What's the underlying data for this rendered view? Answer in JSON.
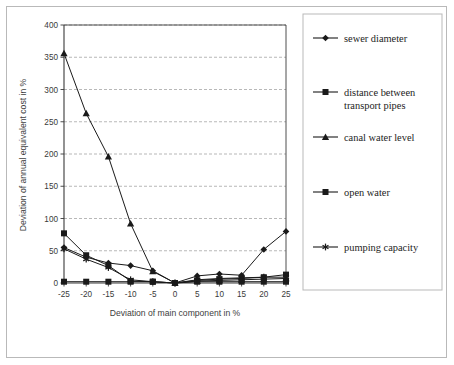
{
  "figure": {
    "name": "sensitivity-analysis-line-chart",
    "background": "#ffffff",
    "frame_color": "#b9b9b9"
  },
  "chart_data": {
    "type": "line",
    "title": "",
    "subtitle": "",
    "xlabel": "Deviation of main component in %",
    "ylabel": "Deviation of annual equivalent cost in %",
    "x": [
      -25,
      -20,
      -15,
      -10,
      -5,
      0,
      5,
      10,
      15,
      20,
      25
    ],
    "xtick_labels": [
      "-25",
      "-20",
      "-15",
      "-10",
      "-5",
      "0",
      "5",
      "10",
      "15",
      "20",
      "25"
    ],
    "ytick_labels": [
      "0",
      "50",
      "100",
      "150",
      "200",
      "250",
      "300",
      "350",
      "400"
    ],
    "yticks": [
      0,
      50,
      100,
      150,
      200,
      250,
      300,
      350,
      400
    ],
    "xlim": [
      -25,
      25
    ],
    "ylim": [
      0,
      400
    ],
    "grid": "horizontal-dashed",
    "legend_position": "right-outside",
    "line_color": "#1a1a1a",
    "marker_color": "#1a1a1a",
    "series": [
      {
        "name": "sewer diameter",
        "marker": "diamond",
        "values": [
          55,
          40,
          31,
          27,
          19,
          0,
          11,
          14,
          12,
          52,
          80
        ]
      },
      {
        "name": "distance between transport pipes",
        "marker": "square",
        "values": [
          77,
          43,
          27,
          3,
          2,
          0,
          4,
          6,
          7,
          9,
          13
        ]
      },
      {
        "name": "canal water level",
        "marker": "triangle",
        "values": [
          356,
          263,
          196,
          92,
          18,
          0,
          3,
          4,
          5,
          6,
          7
        ]
      },
      {
        "name": "open water",
        "marker": "square",
        "values": [
          2,
          2,
          2,
          2,
          2,
          0,
          2,
          2,
          2,
          2,
          2
        ]
      },
      {
        "name": "pumping capacity",
        "marker": "star",
        "values": [
          53,
          37,
          24,
          5,
          2,
          0,
          5,
          7,
          8,
          9,
          9
        ]
      }
    ]
  },
  "legend": {
    "entries": [
      {
        "label": "sewer diameter",
        "marker": "diamond"
      },
      {
        "label": "distance between",
        "label2": "transport pipes",
        "marker": "square"
      },
      {
        "label": "canal water level",
        "marker": "triangle"
      },
      {
        "label": "open water",
        "marker": "square"
      },
      {
        "label": "pumping capacity",
        "marker": "star"
      }
    ]
  }
}
